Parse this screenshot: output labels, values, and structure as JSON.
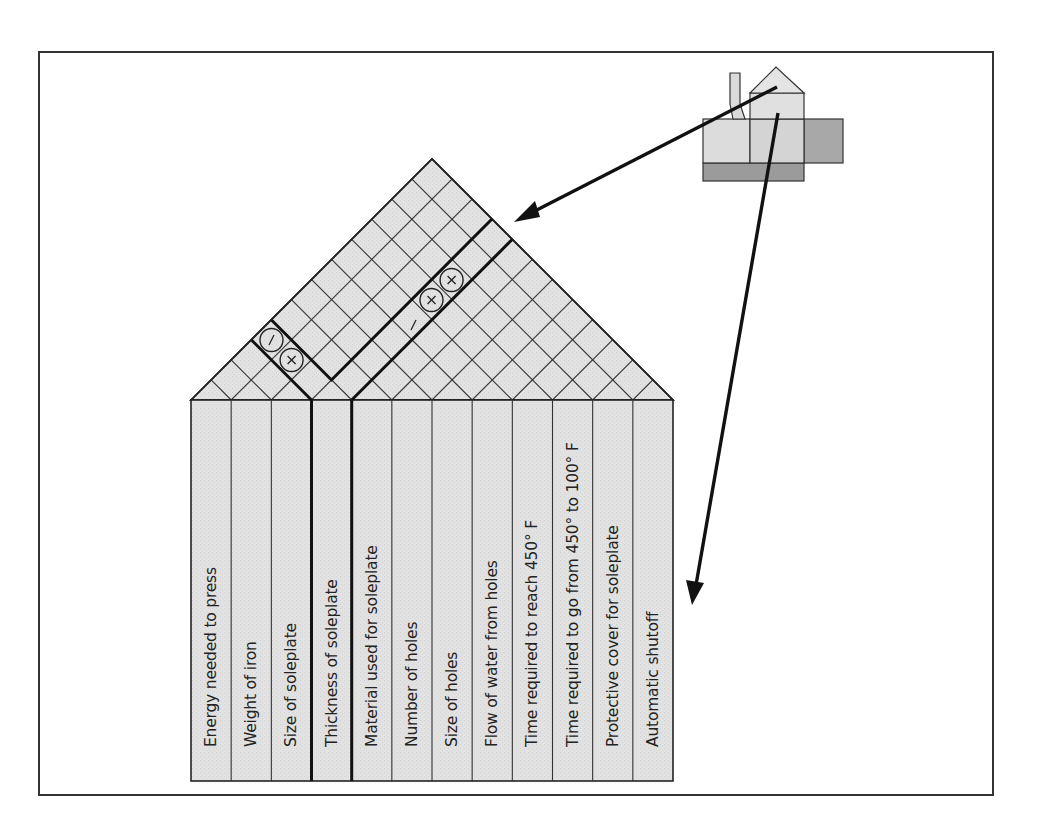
{
  "diagram": {
    "type": "house-of-quality-roof",
    "colors": {
      "fill_light": "#e3e3e3",
      "fill_mid": "#c9c9c9",
      "fill_dark": "#9d9d9d",
      "line": "#222222",
      "background": "#ffffff"
    },
    "columns": [
      {
        "label": "Energy needed to press"
      },
      {
        "label": "Weight of iron"
      },
      {
        "label": "Size of soleplate"
      },
      {
        "label": "Thickness of soleplate"
      },
      {
        "label": "Material used for soleplate"
      },
      {
        "label": "Number of holes"
      },
      {
        "label": "Size of holes"
      },
      {
        "label": "Flow of water from holes"
      },
      {
        "label": "Time required to reach 450° F"
      },
      {
        "label": "Time required to go from 450° to 100° F"
      },
      {
        "label": "Protective cover for soleplate"
      },
      {
        "label": "Automatic shutoff"
      }
    ],
    "correlation_marks": [
      {
        "symbol": "−",
        "circled": true,
        "between": [
          "Size of soleplate",
          "Thickness of soleplate"
        ]
      },
      {
        "symbol": "×",
        "circled": true,
        "between": [
          "Size of soleplate",
          "Material used for soleplate"
        ]
      },
      {
        "symbol": "−",
        "circled": false,
        "between": [
          "Thickness of soleplate",
          "Flow of water from holes"
        ]
      },
      {
        "symbol": "×",
        "circled": true,
        "between": [
          "Thickness of soleplate",
          "Time required to reach 450° F"
        ]
      },
      {
        "symbol": "×",
        "circled": true,
        "between": [
          "Thickness of soleplate",
          "Time required to go from 450° to 100° F"
        ]
      }
    ],
    "inset": {
      "name": "house-of-quality-thumbnail",
      "arrows": [
        {
          "from": "thumbnail-roof",
          "to": "correlation-roof"
        },
        {
          "from": "thumbnail-room",
          "to": "technical-requirements-columns"
        }
      ]
    }
  }
}
